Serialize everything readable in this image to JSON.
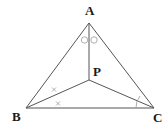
{
  "diagram": {
    "type": "geometry-triangle",
    "points": {
      "A": {
        "label": "A",
        "x": 89,
        "y": 23,
        "label_x": 90,
        "label_y": 15
      },
      "B": {
        "label": "B",
        "x": 26,
        "y": 108,
        "label_x": 17,
        "label_y": 121
      },
      "C": {
        "label": "C",
        "x": 154,
        "y": 108,
        "label_x": 158,
        "label_y": 122
      },
      "P": {
        "label": "P",
        "x": 89,
        "y": 80,
        "label_x": 97,
        "label_y": 74
      }
    },
    "segments": [
      [
        "A",
        "B"
      ],
      [
        "A",
        "C"
      ],
      [
        "B",
        "C"
      ],
      [
        "A",
        "P"
      ],
      [
        "B",
        "P"
      ],
      [
        "C",
        "P"
      ]
    ],
    "angle_marks": [
      {
        "at": "A",
        "symbol": "circle",
        "count": 2,
        "meaning": "angle BAP = angle PAC"
      },
      {
        "at": "B",
        "symbol": "cross",
        "count": 2,
        "meaning": "angle ABP = angle PBC"
      },
      {
        "at": "C",
        "symbol": "arc",
        "count": 1,
        "meaning": "angle PCB"
      }
    ],
    "colors": {
      "line": "#555555",
      "label": "#1a1a1a",
      "mark": "#999999"
    }
  }
}
